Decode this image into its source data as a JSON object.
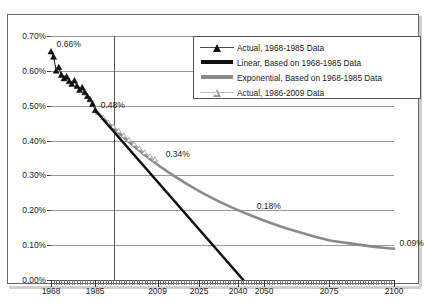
{
  "title": "Actual Data for 1968-2009",
  "legend": {
    "position": "top-right",
    "items": [
      {
        "label": "Actual, 1968-1985 Data",
        "key": "filled-triangle-with-line"
      },
      {
        "label": "Linear, Based on 1968-1985 Data",
        "key": "thick-black-line"
      },
      {
        "label": "Exponential, Based on 1968-1985 Data",
        "key": "thick-gray-line"
      },
      {
        "label": "Actual, 1986-2009 Data",
        "key": "open-triangle-with-line"
      }
    ]
  },
  "axes": {
    "y_ticks": [
      "0.70%",
      "0.60%",
      "0.50%",
      "0.40%",
      "0.30%",
      "0.20%",
      "0.10%",
      "0.00%"
    ],
    "x_ticks": [
      "1968",
      "1985",
      "2009",
      "2025",
      "2040",
      "2050",
      "2075",
      "2100"
    ]
  },
  "annotations": [
    {
      "text": "0.66%",
      "x": 1969,
      "y": 0.66
    },
    {
      "text": "0.48%",
      "x": 1986,
      "y": 0.485
    },
    {
      "text": "0.34%",
      "x": 2011,
      "y": 0.345
    },
    {
      "text": "0.18%",
      "x": 2046,
      "y": 0.195
    },
    {
      "text": "0.09%",
      "x": 2101,
      "y": 0.09
    }
  ],
  "colors": {
    "actual_marker": "#111111",
    "linear_line": "#111111",
    "exponential_line": "#8a8a8a",
    "actual_later_marker": "#9a9a9a",
    "gridline": "#9a9a9a",
    "frame": "#6a6a6a"
  },
  "chart_data": {
    "type": "line",
    "title": "Actual Data for 1968-2009",
    "xlabel": "",
    "ylabel": "",
    "xlim": [
      1968,
      2100
    ],
    "ylim": [
      0.0,
      0.7
    ],
    "ytick_values": [
      0.7,
      0.6,
      0.5,
      0.4,
      0.3,
      0.2,
      0.1,
      0.0
    ],
    "ytick_labels": [
      "0.70%",
      "0.60%",
      "0.50%",
      "0.40%",
      "0.30%",
      "0.20%",
      "0.10%",
      "0.00%"
    ],
    "xtick_values": [
      1968,
      1985,
      2009,
      2025,
      2040,
      2050,
      2075,
      2100
    ],
    "xtick_labels": [
      "1968",
      "1985",
      "2009",
      "2025",
      "2040",
      "2050",
      "2075",
      "2100"
    ],
    "grid": true,
    "legend_position": "upper right",
    "series": [
      {
        "name": "Actual, 1968-1985 Data",
        "type": "scatter-line",
        "marker": "filled-triangle",
        "color": "#111111",
        "x": [
          1968,
          1969,
          1970,
          1971,
          1972,
          1973,
          1974,
          1975,
          1976,
          1977,
          1978,
          1979,
          1980,
          1981,
          1982,
          1983,
          1984,
          1985
        ],
        "y": [
          0.655,
          0.64,
          0.6,
          0.61,
          0.588,
          0.578,
          0.583,
          0.57,
          0.562,
          0.572,
          0.556,
          0.545,
          0.552,
          0.538,
          0.527,
          0.518,
          0.505,
          0.487
        ]
      },
      {
        "name": "Linear, Based on 1968-1985 Data",
        "type": "line",
        "color": "#111111",
        "x": [
          1985,
          2042
        ],
        "y": [
          0.487,
          0.0
        ]
      },
      {
        "name": "Exponential, Based on 1968-1985 Data",
        "type": "line",
        "color": "#8a8a8a",
        "x": [
          1985,
          1995,
          2005,
          2015,
          2025,
          2035,
          2045,
          2055,
          2065,
          2075,
          2085,
          2095,
          2100
        ],
        "y": [
          0.487,
          0.415,
          0.353,
          0.3,
          0.255,
          0.217,
          0.185,
          0.157,
          0.134,
          0.114,
          0.103,
          0.093,
          0.09
        ]
      },
      {
        "name": "Actual, 1986-2009 Data",
        "type": "scatter-line",
        "marker": "open-triangle",
        "color": "#9a9a9a",
        "x": [
          1986,
          1987,
          1988,
          1989,
          1990,
          1991,
          1992,
          1993,
          1994,
          1995,
          1996,
          1997,
          1998,
          1999,
          2000,
          2001,
          2002,
          2003,
          2004,
          2005,
          2006,
          2007,
          2008,
          2009
        ],
        "y": [
          0.48,
          0.472,
          0.466,
          0.459,
          0.452,
          0.447,
          0.44,
          0.434,
          0.428,
          0.421,
          0.415,
          0.408,
          0.402,
          0.396,
          0.39,
          0.384,
          0.378,
          0.372,
          0.366,
          0.36,
          0.355,
          0.35,
          0.346,
          0.342
        ]
      }
    ],
    "annotations": [
      {
        "text": "0.66%",
        "x": 1969,
        "y": 0.66
      },
      {
        "text": "0.48%",
        "x": 1986,
        "y": 0.485
      },
      {
        "text": "0.34%",
        "x": 2011,
        "y": 0.345
      },
      {
        "text": "0.18%",
        "x": 2046,
        "y": 0.195
      },
      {
        "text": "0.09%",
        "x": 2101,
        "y": 0.09
      }
    ]
  }
}
